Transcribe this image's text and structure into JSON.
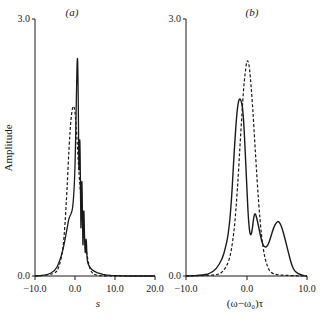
{
  "chart_data": [
    {
      "type": "line",
      "panel_label": "(a)",
      "title": "",
      "xlabel": "s",
      "ylabel": "Amplitude",
      "xlim": [
        -10.0,
        20.0
      ],
      "ylim": [
        0.0,
        3.0
      ],
      "x_ticks": [
        "-10.0",
        "0.0",
        "10.0",
        "20.0"
      ],
      "y_ticks": [
        "0.0",
        "3.0"
      ],
      "grid": false,
      "legend": "none",
      "series": [
        {
          "name": "solid",
          "style": "solid",
          "x": [
            -10.0,
            -7.0,
            -5.0,
            -4.0,
            -3.0,
            -2.0,
            -1.5,
            -1.0,
            -0.5,
            0.0,
            0.3,
            0.6,
            0.8,
            1.0,
            1.2,
            1.4,
            1.5,
            1.7,
            1.9,
            2.0,
            2.2,
            2.4,
            2.6,
            2.8,
            3.0,
            3.2,
            3.5,
            4.0,
            5.0,
            6.0,
            8.0,
            10.0,
            14.0,
            20.0
          ],
          "y": [
            0.0,
            0.01,
            0.06,
            0.15,
            0.3,
            0.55,
            0.68,
            0.72,
            0.8,
            1.2,
            2.0,
            2.68,
            2.2,
            1.0,
            1.8,
            0.9,
            0.4,
            1.3,
            0.6,
            0.25,
            0.9,
            0.4,
            0.22,
            0.5,
            0.2,
            0.15,
            0.12,
            0.08,
            0.05,
            0.03,
            0.01,
            0.005,
            0.0,
            0.0
          ]
        },
        {
          "name": "dashed",
          "style": "dashed",
          "x": [
            -10.0,
            -5.0,
            -4.0,
            -3.0,
            -2.5,
            -2.0,
            -1.5,
            -1.0,
            -0.5,
            0.0,
            0.5,
            1.0,
            1.5,
            2.0,
            2.5,
            3.0,
            3.5,
            4.0,
            5.0,
            7.0,
            20.0
          ],
          "y": [
            0.0,
            0.02,
            0.1,
            0.3,
            0.6,
            1.0,
            1.5,
            1.85,
            2.0,
            1.95,
            1.6,
            1.2,
            0.9,
            0.6,
            0.4,
            0.25,
            0.12,
            0.05,
            0.01,
            0.0,
            0.0
          ]
        }
      ]
    },
    {
      "type": "line",
      "panel_label": "(b)",
      "title": "",
      "xlabel": "(ω−ω₀)τ",
      "ylabel": "",
      "xlim": [
        -10.0,
        10.0
      ],
      "ylim": [
        0.0,
        3.0
      ],
      "x_ticks": [
        "-10.0",
        "0.0",
        "10.0"
      ],
      "y_ticks": [
        "0.0",
        "3.0"
      ],
      "grid": false,
      "legend": "none",
      "series": [
        {
          "name": "solid",
          "style": "solid",
          "x": [
            -10.0,
            -7.0,
            -6.0,
            -5.0,
            -4.0,
            -3.5,
            -3.0,
            -2.5,
            -2.0,
            -1.5,
            -1.0,
            -0.5,
            0.0,
            0.4,
            0.8,
            1.3,
            1.8,
            2.5,
            3.0,
            3.5,
            4.0,
            4.5,
            5.0,
            5.3,
            5.8,
            6.5,
            7.0,
            7.5,
            8.0,
            9.0,
            10.0
          ],
          "y": [
            0.0,
            0.01,
            0.03,
            0.08,
            0.2,
            0.32,
            0.48,
            0.85,
            1.5,
            2.0,
            2.1,
            1.9,
            1.1,
            0.55,
            0.44,
            0.77,
            0.65,
            0.4,
            0.33,
            0.35,
            0.45,
            0.57,
            0.63,
            0.64,
            0.58,
            0.4,
            0.25,
            0.12,
            0.05,
            0.01,
            0.0
          ]
        },
        {
          "name": "dashed",
          "style": "dashed",
          "x": [
            -10.0,
            -5.0,
            -4.0,
            -3.0,
            -2.5,
            -2.0,
            -1.5,
            -1.0,
            -0.5,
            0.0,
            0.2,
            0.5,
            1.0,
            1.5,
            2.0,
            2.5,
            3.0,
            3.5,
            4.0,
            5.0,
            10.0
          ],
          "y": [
            0.0,
            0.01,
            0.04,
            0.15,
            0.3,
            0.55,
            1.0,
            1.6,
            2.2,
            2.5,
            2.52,
            2.45,
            2.0,
            1.4,
            0.85,
            0.45,
            0.22,
            0.1,
            0.04,
            0.01,
            0.0
          ]
        }
      ]
    }
  ],
  "panels": {
    "a": {
      "label": "(a)",
      "ylabel": "Amplitude",
      "xlabel": "s",
      "y_top": "3.0",
      "y_bottom": "0.0",
      "x_ticks": [
        "−10.0",
        "0.0",
        "10.0",
        "20.0"
      ]
    },
    "b": {
      "label": "(b)",
      "xlabel": "(ω−ω₀)τ",
      "y_top": "3.0",
      "y_bottom": "0.0",
      "x_ticks": [
        "−10.0",
        "0.0",
        "10.0"
      ]
    }
  }
}
